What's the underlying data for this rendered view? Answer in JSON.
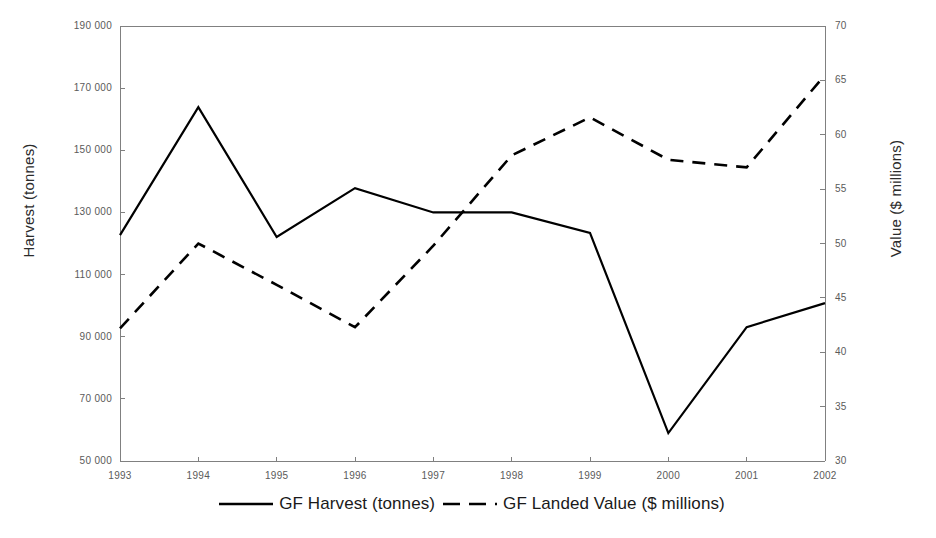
{
  "chart_data": {
    "type": "line",
    "title": "",
    "xlabel": "",
    "ylabel": "Harvest (tonnes)",
    "y2label": "Value ($ millions)",
    "grid": false,
    "legend_position": "bottom",
    "categories": [
      "1993",
      "1994",
      "1995",
      "1996",
      "1997",
      "1998",
      "1999",
      "2000",
      "2001",
      "2002"
    ],
    "x_tick_labels": [
      "1993",
      "1994",
      "1995",
      "1996",
      "1997",
      "1998",
      "1999",
      "2000",
      "2001",
      "2002"
    ],
    "y_tick_labels": [
      "190 000",
      "170 000",
      "150 000",
      "130 000",
      "110 000",
      "90 000",
      "70 000",
      "50 000"
    ],
    "y2_tick_labels": [
      "70",
      "65",
      "60",
      "55",
      "50",
      "45",
      "40",
      "35",
      "30"
    ],
    "ylim": [
      50000,
      190000
    ],
    "y2lim": [
      30,
      70
    ],
    "y_tick_step": 20000,
    "y2_tick_step": 5,
    "series": [
      {
        "name": "GF Harvest (tonnes)",
        "axis": "left",
        "style": "solid",
        "color": "#000000",
        "values": [
          122700,
          163900,
          122100,
          137800,
          130000,
          130000,
          123400,
          59000,
          93100,
          100800
        ]
      },
      {
        "name": "GF Landed Value ($ millions)",
        "axis": "right",
        "style": "dashed",
        "color": "#000000",
        "values": [
          42.2,
          50.0,
          46.2,
          42.3,
          49.8,
          58.1,
          61.6,
          57.7,
          57.0,
          65.5
        ]
      }
    ]
  },
  "legend": {
    "items": [
      {
        "label": "GF Harvest (tonnes)",
        "style": "solid"
      },
      {
        "label": "GF Landed Value ($ millions)",
        "style": "dashed"
      }
    ]
  },
  "axes": {
    "left_title": "Harvest (tonnes)",
    "right_title": "Value ($ millions)"
  },
  "colors": {
    "series": "#000000",
    "axis": "#808080",
    "tick_text": "#5a5a5a",
    "title_text": "#2b2b2b",
    "background": "#ffffff"
  }
}
